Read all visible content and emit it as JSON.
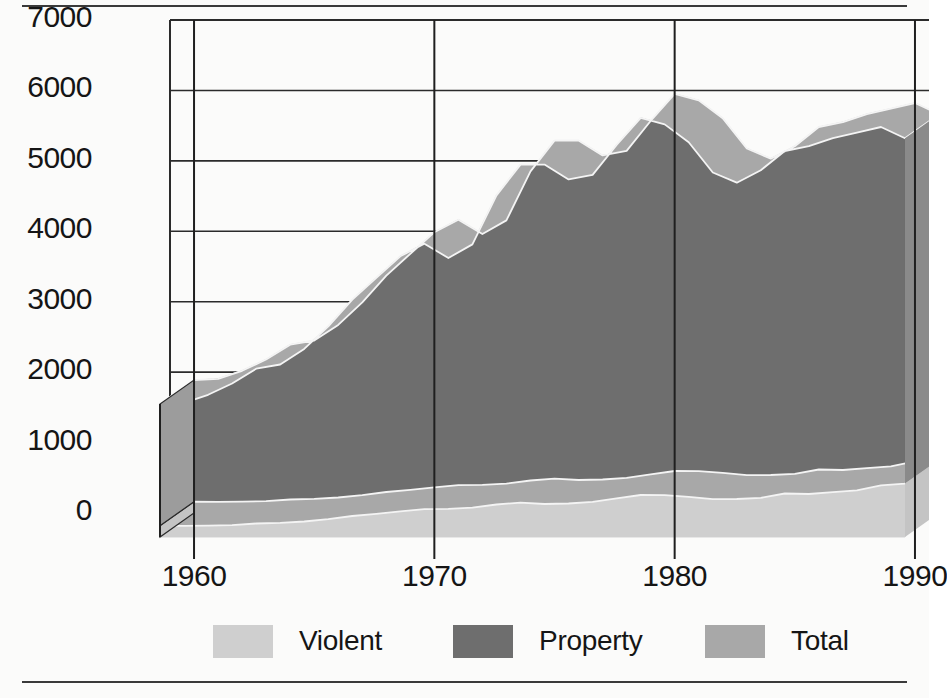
{
  "chart_data": {
    "type": "area",
    "title": "",
    "subtitle": "",
    "xlabel": "",
    "ylabel": "",
    "stacked": true,
    "grid": true,
    "legend_position": "bottom",
    "xlim": [
      1959,
      1991
    ],
    "ylim": [
      0,
      7000
    ],
    "ytick_values": [
      7000,
      6000,
      5000,
      4000,
      3000,
      2000,
      1000,
      0
    ],
    "ytick_labels": [
      "7000",
      "6000",
      "5000",
      "4000",
      "3000",
      "2000",
      "1000",
      "0"
    ],
    "xtick_values": [
      1960,
      1970,
      1980,
      1990
    ],
    "xtick_labels": [
      "1960",
      "1970",
      "1980",
      "1990"
    ],
    "x": [
      1960,
      1961,
      1962,
      1963,
      1964,
      1965,
      1966,
      1967,
      1968,
      1969,
      1970,
      1971,
      1972,
      1973,
      1974,
      1975,
      1976,
      1977,
      1978,
      1979,
      1980,
      1981,
      1982,
      1983,
      1984,
      1985,
      1986,
      1987,
      1988,
      1989,
      1990,
      1991
    ],
    "series": [
      {
        "name": "Violent",
        "color": "#cfcfcf",
        "values": [
          161,
          158,
          162,
          168,
          191,
          200,
          220,
          253,
          298,
          329,
          364,
          396,
          401,
          417,
          461,
          488,
          468,
          476,
          498,
          549,
          597,
          594,
          571,
          538,
          539,
          557,
          618,
          610,
          637,
          663,
          732,
          758
        ]
      },
      {
        "name": "Property",
        "color": "#6e6e6e",
        "values": [
          1726,
          1747,
          1857,
          2012,
          2198,
          2249,
          2451,
          2737,
          3072,
          3351,
          3621,
          3769,
          3561,
          3737,
          4390,
          4800,
          4820,
          4602,
          4643,
          5017,
          5353,
          5264,
          5033,
          4637,
          4492,
          4651,
          4863,
          4940,
          5027,
          5078,
          5089,
          4903
        ]
      },
      {
        "name": "Total",
        "color": "#a8a8a8",
        "values": [
          1887,
          1905,
          2019,
          2180,
          2389,
          2449,
          2671,
          2990,
          3370,
          3680,
          3985,
          4165,
          3962,
          4154,
          4851,
          5288,
          5288,
          5078,
          5141,
          5566,
          5950,
          5858,
          5604,
          5175,
          5031,
          5208,
          5481,
          5550,
          5664,
          5741,
          5821,
          5661
        ]
      }
    ]
  },
  "axes": {
    "y_ticks": [
      "7000",
      "6000",
      "5000",
      "4000",
      "3000",
      "2000",
      "1000",
      "0"
    ],
    "x_ticks": [
      "1960",
      "1970",
      "1980",
      "1990"
    ]
  },
  "legend": {
    "items": [
      {
        "label": "Violent",
        "color": "#cfcfcf"
      },
      {
        "label": "Property",
        "color": "#6e6e6e"
      },
      {
        "label": "Total",
        "color": "#a8a8a8"
      }
    ]
  },
  "colors": {
    "violent": "#cfcfcf",
    "property": "#6e6e6e",
    "total": "#a8a8a8",
    "axis": "#2b2b2b",
    "background": "#fbfbfa",
    "text": "#151515"
  }
}
